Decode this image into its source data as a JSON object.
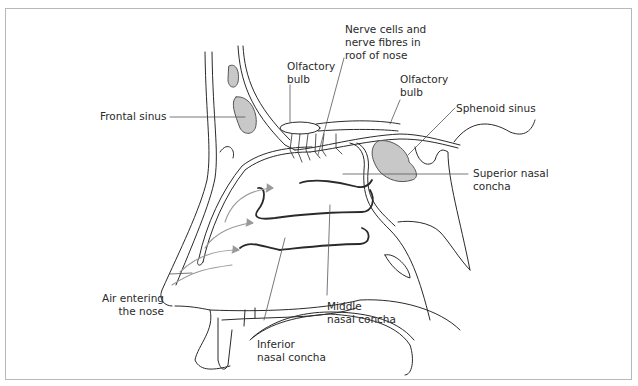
{
  "figure": {
    "colors": {
      "line": "#2a2a2a",
      "sinus_fill": "#c8c8c8",
      "air_arrow": "#999999",
      "leader": "#555555",
      "frame": "#b8b8b8"
    },
    "labels": {
      "frontal_sinus": "Frontal sinus",
      "olfactory_bulb_left_1": "Olfactory",
      "olfactory_bulb_left_2": "bulb",
      "nerve_cells_1": "Nerve cells and",
      "nerve_cells_2": "nerve fibres in",
      "nerve_cells_3": "roof of nose",
      "olfactory_bulb_right_1": "Olfactory",
      "olfactory_bulb_right_2": "bulb",
      "sphenoid_sinus": "Sphenoid sinus",
      "superior_concha_1": "Superior nasal",
      "superior_concha_2": "concha",
      "air_entering_1": "Air entering",
      "air_entering_2": "the nose",
      "middle_concha_1": "Middle",
      "middle_concha_2": "nasal concha",
      "inferior_concha_1": "Inferior",
      "inferior_concha_2": "nasal concha"
    }
  }
}
